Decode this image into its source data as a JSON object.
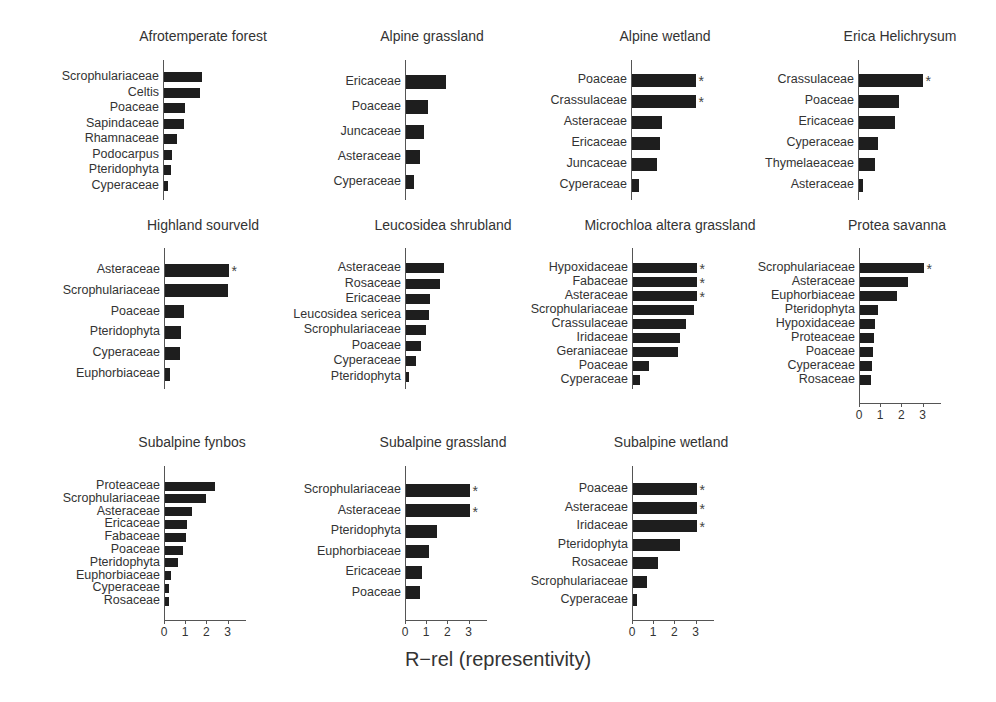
{
  "chart_data": {
    "type": "bar",
    "orientation": "horizontal",
    "xlabel": "R−rel (representivity)",
    "xlim": [
      0,
      3.5
    ],
    "xticks": [
      "0",
      "1",
      "2",
      "3"
    ],
    "annotation_symbol": "*",
    "panels": [
      {
        "title": "Afrotemperate forest",
        "categories": [
          "Scrophulariaceae",
          "Celtis",
          "Poaceae",
          "Sapindaceae",
          "Rhamnaceae",
          "Podocarpus",
          "Pteridophyta",
          "Cyperaceae"
        ],
        "values": [
          1.8,
          1.7,
          1.0,
          0.95,
          0.6,
          0.4,
          0.35,
          0.2
        ],
        "significant": [
          false,
          false,
          false,
          false,
          false,
          false,
          false,
          false
        ],
        "show_xaxis": false
      },
      {
        "title": "Alpine grassland",
        "categories": [
          "Ericaceae",
          "Poaceae",
          "Juncaceae",
          "Asteraceae",
          "Cyperaceae"
        ],
        "values": [
          1.9,
          1.05,
          0.85,
          0.65,
          0.4
        ],
        "significant": [
          false,
          false,
          false,
          false,
          false
        ],
        "show_xaxis": false
      },
      {
        "title": "Alpine wetland",
        "categories": [
          "Poaceae",
          "Crassulaceae",
          "Asteraceae",
          "Ericaceae",
          "Juncaceae",
          "Cyperaceae"
        ],
        "values": [
          3.0,
          3.0,
          1.4,
          1.3,
          1.2,
          0.35
        ],
        "significant": [
          true,
          true,
          false,
          false,
          false,
          false
        ],
        "show_xaxis": false
      },
      {
        "title": "Erica Helichrysum",
        "categories": [
          "Crassulaceae",
          "Poaceae",
          "Ericaceae",
          "Cyperaceae",
          "Thymelaeaceae",
          "Asteraceae"
        ],
        "values": [
          3.0,
          1.9,
          1.7,
          0.9,
          0.75,
          0.2
        ],
        "significant": [
          true,
          false,
          false,
          false,
          false,
          false
        ],
        "show_xaxis": false
      },
      {
        "title": "Highland sourveld",
        "categories": [
          "Asteraceae",
          "Scrophulariaceae",
          "Poaceae",
          "Pteridophyta",
          "Cyperaceae",
          "Euphorbiaceae"
        ],
        "values": [
          3.0,
          2.95,
          0.9,
          0.75,
          0.7,
          0.25
        ],
        "significant": [
          true,
          false,
          false,
          false,
          false,
          false
        ],
        "show_xaxis": false
      },
      {
        "title": "Leucosidea shrubland",
        "categories": [
          "Asteraceae",
          "Rosaceae",
          "Ericaceae",
          "Leucosidea sericea",
          "Scrophulariaceae",
          "Poaceae",
          "Cyperaceae",
          "Pteridophyta"
        ],
        "values": [
          1.8,
          1.6,
          1.15,
          1.1,
          0.95,
          0.7,
          0.45,
          0.15
        ],
        "significant": [
          false,
          false,
          false,
          false,
          false,
          false,
          false,
          false
        ],
        "show_xaxis": false
      },
      {
        "title": "Microchloa altera grassland",
        "categories": [
          "Hypoxidaceae",
          "Fabaceae",
          "Asteraceae",
          "Scrophulariaceae",
          "Crassulaceae",
          "Iridaceae",
          "Geraniaceae",
          "Poaceae",
          "Cyperaceae"
        ],
        "values": [
          3.0,
          3.0,
          3.0,
          2.9,
          2.5,
          2.2,
          2.1,
          0.75,
          0.35
        ],
        "significant": [
          true,
          true,
          true,
          false,
          false,
          false,
          false,
          false,
          false
        ],
        "show_xaxis": false
      },
      {
        "title": "Protea savanna",
        "categories": [
          "Scrophulariaceae",
          "Asteraceae",
          "Euphorbiaceae",
          "Pteridophyta",
          "Hypoxidaceae",
          "Proteaceae",
          "Poaceae",
          "Cyperaceae",
          "Rosaceae"
        ],
        "values": [
          3.0,
          2.25,
          1.75,
          0.85,
          0.7,
          0.65,
          0.6,
          0.55,
          0.5
        ],
        "significant": [
          true,
          false,
          false,
          false,
          false,
          false,
          false,
          false,
          false
        ],
        "show_xaxis": true
      },
      {
        "title": "Subalpine fynbos",
        "categories": [
          "Proteaceae",
          "Scrophulariaceae",
          "Asteraceae",
          "Ericaceae",
          "Fabaceae",
          "Poaceae",
          "Pteridophyta",
          "Euphorbiaceae",
          "Cyperaceae",
          "Rosaceae"
        ],
        "values": [
          2.35,
          1.95,
          1.25,
          1.05,
          1.0,
          0.85,
          0.6,
          0.3,
          0.2,
          0.2
        ],
        "significant": [
          false,
          false,
          false,
          false,
          false,
          false,
          false,
          false,
          false,
          false
        ],
        "show_xaxis": true
      },
      {
        "title": "Subalpine grassland",
        "categories": [
          "Scrophulariaceae",
          "Asteraceae",
          "Pteridophyta",
          "Euphorbiaceae",
          "Ericaceae",
          "Poaceae"
        ],
        "values": [
          3.0,
          3.0,
          1.45,
          1.1,
          0.75,
          0.65
        ],
        "significant": [
          true,
          true,
          false,
          false,
          false,
          false
        ],
        "show_xaxis": true
      },
      {
        "title": "Subalpine wetland",
        "categories": [
          "Poaceae",
          "Asteraceae",
          "Iridaceae",
          "Pteridophyta",
          "Rosaceae",
          "Scrophulariaceae",
          "Cyperaceae"
        ],
        "values": [
          3.0,
          3.0,
          3.0,
          2.2,
          1.2,
          0.65,
          0.2
        ],
        "significant": [
          true,
          true,
          true,
          false,
          false,
          false,
          false
        ],
        "show_xaxis": true
      }
    ]
  },
  "layout": {
    "px_per_unit": 21.2,
    "panels": [
      {
        "title_x": 203,
        "title_y": 38,
        "axis_x": 163,
        "axis_top": 60,
        "axis_bottom": 200,
        "first_row_y": 77,
        "row_step": 15.5,
        "bar_h": 10
      },
      {
        "title_x": 432,
        "title_y": 38,
        "axis_x": 405,
        "axis_top": 60,
        "axis_bottom": 200,
        "first_row_y": 82,
        "row_step": 25,
        "bar_h": 14
      },
      {
        "title_x": 665,
        "title_y": 38,
        "axis_x": 631,
        "axis_top": 60,
        "axis_bottom": 200,
        "first_row_y": 80,
        "row_step": 21,
        "bar_h": 13
      },
      {
        "title_x": 900,
        "title_y": 38,
        "axis_x": 858,
        "axis_top": 60,
        "axis_bottom": 200,
        "first_row_y": 80,
        "row_step": 21,
        "bar_h": 13
      },
      {
        "title_x": 203,
        "title_y": 227,
        "axis_x": 164,
        "axis_top": 248,
        "axis_bottom": 389,
        "first_row_y": 270,
        "row_step": 20.8,
        "bar_h": 13
      },
      {
        "title_x": 443,
        "title_y": 227,
        "axis_x": 405,
        "axis_top": 248,
        "axis_bottom": 389,
        "first_row_y": 268,
        "row_step": 15.5,
        "bar_h": 10
      },
      {
        "title_x": 670,
        "title_y": 227,
        "axis_x": 632,
        "axis_top": 248,
        "axis_bottom": 389,
        "first_row_y": 268,
        "row_step": 14,
        "bar_h": 10
      },
      {
        "title_x": 897,
        "title_y": 227,
        "axis_x": 859,
        "axis_top": 248,
        "axis_bottom": 403,
        "first_row_y": 268,
        "row_step": 14,
        "bar_h": 10
      },
      {
        "title_x": 192,
        "title_y": 444,
        "axis_x": 164,
        "axis_top": 466,
        "axis_bottom": 620,
        "first_row_y": 486,
        "row_step": 12.8,
        "bar_h": 9
      },
      {
        "title_x": 443,
        "title_y": 444,
        "axis_x": 405,
        "axis_top": 466,
        "axis_bottom": 620,
        "first_row_y": 490,
        "row_step": 20.5,
        "bar_h": 13
      },
      {
        "title_x": 671,
        "title_y": 444,
        "axis_x": 632,
        "axis_top": 466,
        "axis_bottom": 620,
        "first_row_y": 489,
        "row_step": 18.5,
        "bar_h": 12
      }
    ]
  }
}
